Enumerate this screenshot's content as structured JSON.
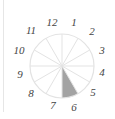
{
  "diagram": {
    "type": "clock-fraction",
    "labels": [
      "12",
      "1",
      "2",
      "3",
      "4",
      "5",
      "6",
      "7",
      "8",
      "9",
      "10",
      "11"
    ],
    "sectors": 12,
    "shaded_sectors": [
      "5-6"
    ],
    "colors": {
      "shaded": "#a3a3a3",
      "lines": "#e3e3e3",
      "label": "#444444"
    }
  }
}
